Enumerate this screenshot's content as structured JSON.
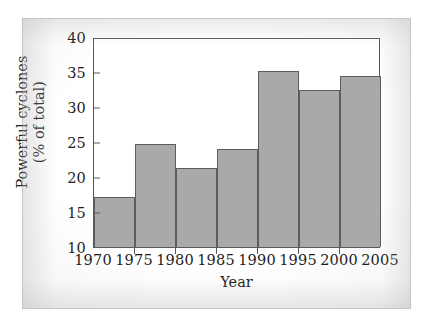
{
  "chart_data": {
    "type": "bar",
    "title": "",
    "xlabel": "Year",
    "ylabel": "Powerful cyclones (% of total)",
    "ylabel_line1": "Powerful cyclones",
    "ylabel_line2": "(% of total)",
    "categories": [
      "1970",
      "1975",
      "1980",
      "1985",
      "1990",
      "1995",
      "2000"
    ],
    "bar_spans": [
      {
        "start": 1970,
        "end": 1975
      },
      {
        "start": 1975,
        "end": 1980
      },
      {
        "start": 1980,
        "end": 1985
      },
      {
        "start": 1985,
        "end": 1990
      },
      {
        "start": 1990,
        "end": 1995
      },
      {
        "start": 1995,
        "end": 2000
      },
      {
        "start": 2000,
        "end": 2005
      }
    ],
    "values": [
      17.1,
      24.7,
      21.3,
      24.0,
      35.1,
      32.5,
      34.5
    ],
    "xlim": [
      1970,
      2005
    ],
    "ylim": [
      10,
      40
    ],
    "ytick_labels": [
      "10",
      "15",
      "20",
      "25",
      "30",
      "35",
      "40"
    ],
    "ytick_values": [
      10,
      15,
      20,
      25,
      30,
      35,
      40
    ],
    "xtick_labels": [
      "1970",
      "1975",
      "1980",
      "1985",
      "1990",
      "1995",
      "2000",
      "2005"
    ],
    "xtick_values": [
      1970,
      1975,
      1980,
      1985,
      1990,
      1995,
      2000,
      2005
    ],
    "grid": false,
    "legend": null,
    "bar_color": "#a9a9a9",
    "bar_edge_color": "#5d5d5f",
    "axis_color": "#58585a",
    "plot_background": "#ffffff",
    "text_color": "#1d1d1d"
  }
}
